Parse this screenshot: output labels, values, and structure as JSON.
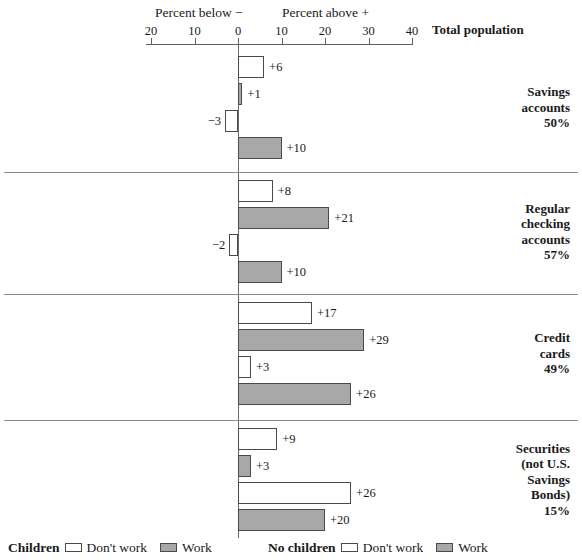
{
  "chart_data": {
    "type": "bar",
    "orientation": "horizontal",
    "title": "",
    "axis_caption_left": "Percent below −",
    "axis_caption_right": "Percent above +",
    "header_label": "Total population",
    "xlabel": "",
    "ylabel": "",
    "xlim": [
      -20,
      40
    ],
    "grid": false,
    "axis_ticks": [
      {
        "label": "20",
        "value": -20
      },
      {
        "label": "10",
        "value": -10
      },
      {
        "label": "0",
        "value": 0
      },
      {
        "label": "10",
        "value": 10
      },
      {
        "label": "20",
        "value": 20
      },
      {
        "label": "30",
        "value": 30
      },
      {
        "label": "40",
        "value": 40
      }
    ],
    "series": [
      {
        "name": "Children / Don't work",
        "fill": "white"
      },
      {
        "name": "Children / Work",
        "fill": "gray"
      },
      {
        "name": "No children / Don't work",
        "fill": "white"
      },
      {
        "name": "No children / Work",
        "fill": "gray"
      }
    ],
    "categories": [
      "Savings accounts 50%",
      "Regular checking accounts 57%",
      "Credit cards 49%",
      "Securities (not U.S. Savings Bonds) 15%"
    ],
    "groups": [
      {
        "id": "savings-accounts",
        "label_lines": [
          "Savings",
          "accounts",
          "50%"
        ],
        "bars": [
          {
            "series": "Children / Don't work",
            "value": 6,
            "label": "+6",
            "fill": "white"
          },
          {
            "series": "Children / Work",
            "value": 1,
            "label": "+1",
            "fill": "gray"
          },
          {
            "series": "No children / Don't work",
            "value": -3,
            "label": "−3",
            "fill": "white"
          },
          {
            "series": "No children / Work",
            "value": 10,
            "label": "+10",
            "fill": "gray"
          }
        ]
      },
      {
        "id": "regular-checking-accounts",
        "label_lines": [
          "Regular",
          "checking",
          "accounts",
          "57%"
        ],
        "bars": [
          {
            "series": "Children / Don't work",
            "value": 8,
            "label": "+8",
            "fill": "white"
          },
          {
            "series": "Children / Work",
            "value": 21,
            "label": "+21",
            "fill": "gray"
          },
          {
            "series": "No children / Don't work",
            "value": -2,
            "label": "−2",
            "fill": "white"
          },
          {
            "series": "No children / Work",
            "value": 10,
            "label": "+10",
            "fill": "gray"
          }
        ]
      },
      {
        "id": "credit-cards",
        "label_lines": [
          "Credit",
          "cards",
          "49%"
        ],
        "bars": [
          {
            "series": "Children / Don't work",
            "value": 17,
            "label": "+17",
            "fill": "white"
          },
          {
            "series": "Children / Work",
            "value": 29,
            "label": "+29",
            "fill": "gray"
          },
          {
            "series": "No children / Don't work",
            "value": 3,
            "label": "+3",
            "fill": "white"
          },
          {
            "series": "No children / Work",
            "value": 26,
            "label": "+26",
            "fill": "gray"
          }
        ]
      },
      {
        "id": "securities",
        "label_lines": [
          "Securities",
          "(not U.S.",
          "Savings",
          "Bonds)",
          "15%"
        ],
        "bars": [
          {
            "series": "Children / Don't work",
            "value": 9,
            "label": "+9",
            "fill": "white"
          },
          {
            "series": "Children / Work",
            "value": 3,
            "label": "+3",
            "fill": "gray"
          },
          {
            "series": "No children / Don't work",
            "value": 26,
            "label": "+26",
            "fill": "white"
          },
          {
            "series": "No children / Work",
            "value": 20,
            "label": "+20",
            "fill": "gray"
          }
        ]
      }
    ],
    "legend": {
      "position": "bottom",
      "entries": [
        {
          "group": "Children",
          "items": [
            {
              "label": "Don't work",
              "fill": "white"
            },
            {
              "label": "Work",
              "fill": "gray"
            }
          ]
        },
        {
          "group": "No children",
          "items": [
            {
              "label": "Don't work",
              "fill": "white"
            },
            {
              "label": "Work",
              "fill": "gray"
            }
          ]
        }
      ]
    },
    "colors": {
      "bar_white": "#ffffff",
      "bar_gray": "#a8a8a8",
      "bar_border": "#4a4a4a",
      "axis": "#5e5e5e",
      "separator": "#8c8c8c",
      "text": "#1a1a1a",
      "background": "#ffffff"
    }
  }
}
